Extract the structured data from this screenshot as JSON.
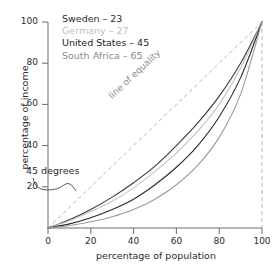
{
  "chart_data": {
    "type": "line",
    "title": "",
    "xlabel": "percentage of population",
    "ylabel": "percentage of income",
    "xlim": [
      0,
      100
    ],
    "ylim": [
      0,
      100
    ],
    "xticks": [
      "0",
      "20",
      "40",
      "60",
      "80",
      "100"
    ],
    "yticks": [
      "20",
      "40",
      "60",
      "80",
      "100"
    ],
    "xtick_values": [
      0,
      20,
      40,
      60,
      80,
      100
    ],
    "ytick_values": [
      20,
      40,
      60,
      80,
      100
    ],
    "grid": false,
    "legend_position": "top-left",
    "x": [
      0,
      10,
      20,
      30,
      40,
      50,
      60,
      70,
      80,
      90,
      100
    ],
    "series": [
      {
        "name": "Sweden",
        "gini": 23,
        "label": "Sweden – 23",
        "color": "#3a3a3a",
        "values": [
          0,
          4,
          9,
          15,
          22,
          30,
          40,
          51,
          64,
          80,
          100
        ]
      },
      {
        "name": "Germany",
        "gini": 27,
        "label": "Germany – 27",
        "color": "#c2c2c2",
        "values": [
          0,
          3.5,
          8,
          13,
          19.5,
          27.5,
          36.5,
          47,
          60,
          77.5,
          100
        ]
      },
      {
        "name": "United States",
        "gini": 45,
        "label": "United States – 45",
        "color": "#2b2b2b",
        "values": [
          0,
          2,
          5,
          9,
          14,
          21,
          29.5,
          40,
          54,
          73,
          100
        ]
      },
      {
        "name": "South Africa",
        "gini": 65,
        "label": "South Africa – 65",
        "color": "#9a9a9a",
        "values": [
          0,
          1.2,
          3,
          5.5,
          9,
          14,
          21,
          30.5,
          44,
          65,
          100
        ]
      }
    ],
    "reference_line": {
      "name": "line of equality",
      "label": "line of equality",
      "style": "dashed",
      "color": "#b9b9b9",
      "from": [
        0,
        0
      ],
      "to": [
        100,
        100
      ]
    },
    "vertical_guide": {
      "name": "x-100-guide",
      "style": "dashed",
      "color": "#b9b9b9",
      "x": 100
    },
    "annotations": [
      {
        "name": "45-degrees",
        "text": "45 degrees",
        "points_to": "line of equality"
      },
      {
        "name": "line-of-equality",
        "text": "line of equality"
      }
    ]
  },
  "axes": {
    "y_title": "percentage of income",
    "x_title": "percentage of population",
    "y_tick_labels": [
      "100",
      "80",
      "60",
      "40",
      "20"
    ],
    "x_tick_labels": [
      "0",
      "20",
      "40",
      "60",
      "80",
      "100"
    ]
  },
  "legend": {
    "items": [
      {
        "label": "Sweden – 23",
        "color": "#2b2b2b"
      },
      {
        "label": "Germany – 27",
        "color": "#bdbdbd"
      },
      {
        "label": "United States – 45",
        "color": "#1c1c1c"
      },
      {
        "label": "South Africa – 65",
        "color": "#8a8a8a"
      }
    ]
  },
  "annotations": {
    "degrees_45": "45 degrees",
    "line_of_equality": "line of equality"
  }
}
